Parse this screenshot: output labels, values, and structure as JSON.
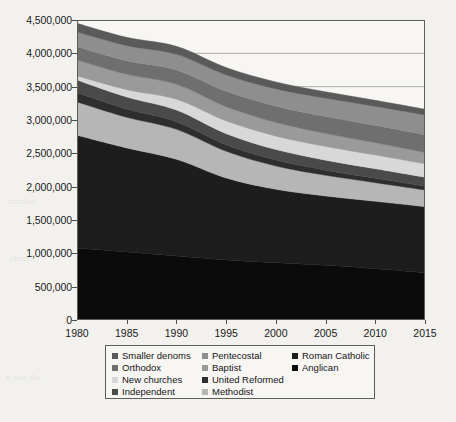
{
  "chart_data": {
    "type": "area",
    "stacked": true,
    "title": "",
    "xlabel": "",
    "ylabel": "",
    "x": [
      1980,
      1985,
      1990,
      1995,
      2000,
      2005,
      2010,
      2015
    ],
    "xlim": [
      1980,
      2015
    ],
    "ylim": [
      0,
      4500000
    ],
    "ytick_values": [
      0,
      500000,
      1000000,
      1500000,
      2000000,
      2500000,
      3000000,
      3500000,
      4000000,
      4500000
    ],
    "ytick_labels": [
      "0",
      "500,000",
      "1,000,000",
      "1,500,000",
      "2,000,000",
      "2,500,000",
      "3,000,000",
      "3,500,000",
      "4,000,000",
      "4,500,000"
    ],
    "xtick_labels": [
      "1980",
      "1985",
      "1990",
      "1995",
      "2000",
      "2005",
      "2010",
      "2015"
    ],
    "grid": true,
    "grid_axis": "y",
    "legend_position": "below-plot",
    "legend_columns": 3,
    "series": [
      {
        "name": "Anglican",
        "color": "#0b0b0b",
        "values": [
          1080000,
          1020000,
          960000,
          900000,
          860000,
          820000,
          770000,
          710000
        ]
      },
      {
        "name": "Roman Catholic",
        "color": "#1d1d1d",
        "values": [
          1690000,
          1560000,
          1450000,
          1230000,
          1100000,
          1040000,
          1010000,
          990000
        ]
      },
      {
        "name": "Methodist",
        "color": "#b6b6b6",
        "values": [
          500000,
          460000,
          450000,
          400000,
          350000,
          310000,
          280000,
          250000
        ]
      },
      {
        "name": "United Reformed",
        "color": "#2e2e2e",
        "values": [
          140000,
          125000,
          115000,
          100000,
          90000,
          78000,
          66000,
          56000
        ]
      },
      {
        "name": "Independent",
        "color": "#4a4a4a",
        "values": [
          190000,
          180000,
          175000,
          165000,
          158000,
          150000,
          143000,
          136000
        ]
      },
      {
        "name": "New churches",
        "color": "#d8d8d8",
        "values": [
          60000,
          110000,
          160000,
          190000,
          200000,
          205000,
          205000,
          200000
        ]
      },
      {
        "name": "Baptist",
        "color": "#9a9a9a",
        "values": [
          240000,
          230000,
          225000,
          215000,
          205000,
          195000,
          183000,
          170000
        ]
      },
      {
        "name": "Orthodox",
        "color": "#6f6f6f",
        "values": [
          200000,
          205000,
          215000,
          230000,
          245000,
          255000,
          262000,
          268000
        ]
      },
      {
        "name": "Pentecostal",
        "color": "#8e8e8e",
        "values": [
          220000,
          225000,
          235000,
          245000,
          258000,
          272000,
          285000,
          296000
        ]
      },
      {
        "name": "Smaller denoms",
        "color": "#5a5a5a",
        "values": [
          130000,
          125000,
          120000,
          112000,
          105000,
          98000,
          92000,
          86000
        ]
      }
    ]
  },
  "axes": {
    "y_labels": [
      "4,500,000",
      "4,000,000",
      "3,500,000",
      "3,000,000",
      "2,500,000",
      "2,000,000",
      "1,500,000",
      "1,000,000",
      "500,000",
      "0"
    ],
    "x_labels": [
      "1980",
      "1985",
      "1990",
      "1995",
      "2000",
      "2005",
      "2010",
      "2015"
    ]
  },
  "legend": {
    "columns": [
      [
        {
          "label": "Smaller denoms",
          "color": "#5a5a5a"
        },
        {
          "label": "Orthodox",
          "color": "#6f6f6f"
        },
        {
          "label": "New churches",
          "color": "#d8d8d8"
        },
        {
          "label": "Independent",
          "color": "#4a4a4a"
        }
      ],
      [
        {
          "label": "Pentecostal",
          "color": "#8e8e8e"
        },
        {
          "label": "Baptist",
          "color": "#9a9a9a"
        },
        {
          "label": "United Reformed",
          "color": "#2e2e2e"
        },
        {
          "label": "Methodist",
          "color": "#b6b6b6"
        }
      ],
      [
        {
          "label": "Roman Catholic",
          "color": "#1d1d1d"
        },
        {
          "label": "Anglican",
          "color": "#0b0b0b"
        }
      ]
    ]
  },
  "caption": {
    "text": ""
  }
}
